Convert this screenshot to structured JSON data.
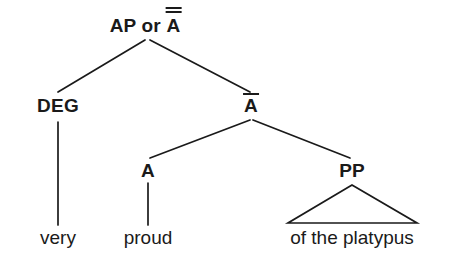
{
  "figure": {
    "type": "syntax-tree",
    "background_color": "#ffffff",
    "line_color": "#1a1a1a",
    "text_color": "#1a1a1a"
  },
  "nodes": {
    "root": {
      "label_prefix": "AP or ",
      "label_letter": "A",
      "bar_count": 2,
      "x": 145,
      "y": 25
    },
    "deg": {
      "label": "DEG",
      "bar_count": 0,
      "x": 58,
      "y": 105
    },
    "abar": {
      "label_letter": "A",
      "bar_count": 1,
      "x": 251,
      "y": 105
    },
    "head_a": {
      "label": "A",
      "bar_count": 0,
      "x": 148,
      "y": 170
    },
    "pp": {
      "label": "PP",
      "bar_count": 0,
      "x": 352,
      "y": 170
    }
  },
  "terminals": {
    "very": {
      "text": "very",
      "x": 58,
      "y": 237
    },
    "proud": {
      "text": "proud",
      "x": 148,
      "y": 237
    },
    "of_the_platypus": {
      "text": "of the platypus",
      "x": 352,
      "y": 237
    }
  },
  "edges": [
    {
      "name": "root-to-deg",
      "from": "root",
      "to": "deg",
      "x1": 145,
      "y1": 40,
      "x2": 58,
      "y2": 92,
      "kind": "branch"
    },
    {
      "name": "root-to-abar",
      "from": "root",
      "to": "abar",
      "x1": 150,
      "y1": 40,
      "x2": 250,
      "y2": 92,
      "kind": "branch"
    },
    {
      "name": "abar-to-a",
      "from": "abar",
      "to": "head_a",
      "x1": 250,
      "y1": 120,
      "x2": 150,
      "y2": 158,
      "kind": "branch"
    },
    {
      "name": "abar-to-pp",
      "from": "abar",
      "to": "pp",
      "x1": 253,
      "y1": 120,
      "x2": 350,
      "y2": 158,
      "kind": "branch"
    },
    {
      "name": "deg-to-very",
      "from": "deg",
      "to": "very",
      "x1": 58,
      "y1": 122,
      "x2": 58,
      "y2": 225,
      "kind": "stem"
    },
    {
      "name": "a-to-proud",
      "from": "head_a",
      "to": "proud",
      "x1": 148,
      "y1": 183,
      "x2": 148,
      "y2": 225,
      "kind": "stem"
    }
  ],
  "triangle": {
    "name": "pp-triangle",
    "apex_x": 352,
    "apex_y": 185,
    "base_left_x": 288,
    "base_right_x": 417,
    "base_y": 223
  }
}
